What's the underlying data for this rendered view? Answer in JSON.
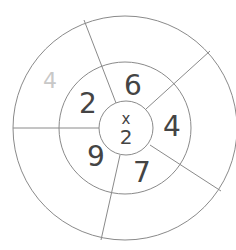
{
  "diagram": {
    "center_operation": {
      "operator": "x",
      "operand": "2"
    },
    "inner_ring": [
      {
        "position": "top",
        "value": "6"
      },
      {
        "position": "right",
        "value": "4"
      },
      {
        "position": "bottom-right",
        "value": "7"
      },
      {
        "position": "bottom-left",
        "value": "9"
      },
      {
        "position": "left",
        "value": "2"
      }
    ],
    "outer_ring": [
      {
        "position": "upper-left",
        "value": "4",
        "style": "faded"
      },
      {
        "position": "top-right",
        "value": ""
      },
      {
        "position": "right",
        "value": ""
      },
      {
        "position": "bottom",
        "value": ""
      },
      {
        "position": "lower-left",
        "value": ""
      }
    ],
    "colors": {
      "line": "#8a8a8a",
      "text": "#444444",
      "faded_text": "#c8c8c8"
    }
  }
}
